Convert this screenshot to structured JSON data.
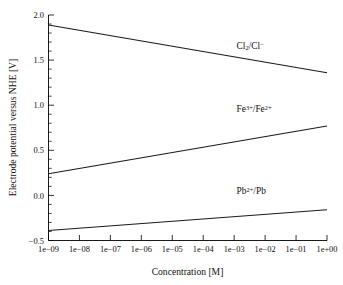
{
  "chart_data": {
    "type": "line",
    "title": "",
    "xlabel": "Concentration [M]",
    "ylabel": "Electrode potential versus NHE [V]",
    "xscale": "log",
    "xlim": [
      1e-09,
      1.0
    ],
    "ylim": [
      -0.5,
      2.0
    ],
    "grid": false,
    "legend": "inline-labels",
    "xticklabels": [
      "1e-09",
      "1e-08",
      "1e-07",
      "1e-06",
      "1e-05",
      "1e-04",
      "1e-03",
      "1e-02",
      "1e-01",
      "1e+00"
    ],
    "xtickvalues": [
      -9,
      -8,
      -7,
      -6,
      -5,
      -4,
      -3,
      -2,
      -1,
      0
    ],
    "yticklabels": [
      "-0.5",
      "0.0",
      "0.5",
      "1.0",
      "1.5",
      "2.0"
    ],
    "ytickvalues": [
      -0.5,
      0.0,
      0.5,
      1.0,
      1.5,
      2.0
    ],
    "x": [
      1e-09,
      1.0
    ],
    "series": [
      {
        "name": "Cl2/Cl-",
        "label_html": "Cl<sub>2</sub>/Cl<sup>−</sup>",
        "values": [
          1.89,
          1.36
        ],
        "label_x": 0.0012,
        "label_y": 1.62,
        "color": "#1a1a1a"
      },
      {
        "name": "Fe3+/Fe2+",
        "label_html": "Fe<sup>3+</sup>/Fe<sup>2+</sup>",
        "values": [
          0.24,
          0.77
        ],
        "label_x": 0.0012,
        "label_y": 0.93,
        "color": "#1a1a1a"
      },
      {
        "name": "Pb2+/Pb",
        "label_html": "Pb<sup>2+</sup>/Pb",
        "values": [
          -0.39,
          -0.16
        ],
        "label_x": 0.0012,
        "label_y": 0.02,
        "color": "#1a1a1a"
      }
    ]
  },
  "labels": {
    "x_axis_title": "Concentration [M]",
    "y_axis_title": "Electrode potential versus NHE [V]",
    "xtick_0": "1e-09",
    "xtick_1": "1e-08",
    "xtick_2": "1e-07",
    "xtick_3": "1e-06",
    "xtick_4": "1e-05",
    "xtick_5": "1e-04",
    "xtick_6": "1e-03",
    "xtick_7": "1e-02",
    "xtick_8": "1e-01",
    "xtick_9": "1e+00",
    "ytick_0": "-0.5",
    "ytick_1": "0.0",
    "ytick_2": "0.5",
    "ytick_3": "1.0",
    "ytick_4": "1.5",
    "ytick_5": "2.0",
    "series_label_cl": "Cl2/Cl−",
    "series_label_fe": "Fe3+/Fe2+",
    "series_label_pb": "Pb2+/Pb"
  }
}
